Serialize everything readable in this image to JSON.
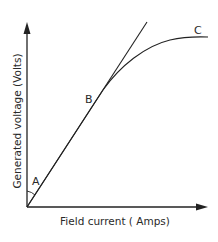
{
  "diagram": {
    "axes": {
      "x_label": "Field current ( Amps)",
      "y_label": "Generated voltage (Volts)"
    },
    "points": [
      {
        "id": "A",
        "label": "A",
        "description": "Angle marker near origin between y-axis and curve"
      },
      {
        "id": "B",
        "label": "B",
        "description": "Point on linear region where curve begins to depart from tangent"
      },
      {
        "id": "C",
        "label": "C",
        "description": "Saturation region where curve flattens"
      }
    ],
    "lines": [
      {
        "id": "tangent",
        "description": "Straight air-gap line from origin"
      },
      {
        "id": "curve",
        "description": "Magnetization curve rising linearly then saturating"
      }
    ],
    "colors": {
      "stroke": "#222222",
      "text": "#2a2a2a",
      "background": "#ffffff"
    }
  }
}
